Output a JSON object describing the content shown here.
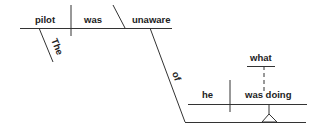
{
  "diagram": {
    "type": "sentence-diagram",
    "main_clause": {
      "subject": "pilot",
      "verb": "was",
      "predicate_adjective": "unaware",
      "subject_modifier": "The",
      "preposition": "of"
    },
    "noun_clause": {
      "subject": "he",
      "verb": "was doing",
      "object": "what"
    }
  }
}
